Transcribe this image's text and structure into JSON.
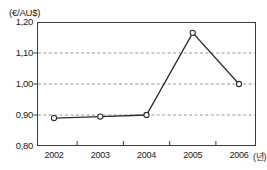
{
  "chart_data": {
    "type": "line",
    "title": "",
    "subtitle": "",
    "unit_label": "(€/AU$)",
    "xlabel": "",
    "xlabel_suffix": "(년)",
    "ylabel": "",
    "categories": [
      "2002",
      "2003",
      "2004",
      "2005",
      "2006"
    ],
    "x": [
      2002,
      2003,
      2004,
      2005,
      2006
    ],
    "values": [
      0.89,
      0.895,
      0.9,
      1.165,
      1.0
    ],
    "series": [
      {
        "name": "€/AU$",
        "values": [
          0.89,
          0.895,
          0.9,
          1.165,
          1.0
        ]
      }
    ],
    "ylim": [
      0.8,
      1.2
    ],
    "yticks": [
      0.8,
      0.9,
      1.0,
      1.1,
      1.2
    ],
    "ytick_labels": [
      "0,80",
      "0,90",
      "1,00",
      "1,10",
      "1,20"
    ],
    "gridlines_y": [
      0.9,
      1.0,
      1.1
    ],
    "grid": true,
    "grid_style": "dashed",
    "legend": false,
    "legend_position": "none",
    "marker": "open-circle",
    "line_color": "#2b2b2b",
    "grid_color": "#8a8a8a",
    "frame_color": "#3a3a3a",
    "marker_face": "#ffffff",
    "background": "#ffffff"
  },
  "axes": {
    "y_ticks": [
      {
        "label": "1,20",
        "value": 1.2
      },
      {
        "label": "1,10",
        "value": 1.1
      },
      {
        "label": "1,00",
        "value": 1.0
      },
      {
        "label": "0,90",
        "value": 0.9
      },
      {
        "label": "0,80",
        "value": 0.8
      }
    ],
    "x_ticks": [
      {
        "label": "2002",
        "value": 2002
      },
      {
        "label": "2003",
        "value": 2003
      },
      {
        "label": "2004",
        "value": 2004
      },
      {
        "label": "2005",
        "value": 2005
      },
      {
        "label": "2006",
        "value": 2006
      }
    ],
    "x_suffix": "(년)"
  }
}
